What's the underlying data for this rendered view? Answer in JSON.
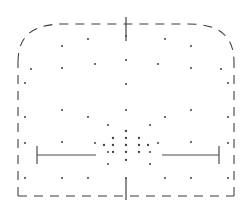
{
  "figure": {
    "type": "technical-line-drawing",
    "width": 252,
    "height": 212,
    "background_color": "#ffffff",
    "line_color": "#3a3a40",
    "dot_color": "#4b4b52",
    "accent_color": "#4a4a50"
  },
  "chart_data": {
    "type": "scatter",
    "xlabel": "",
    "ylabel": "",
    "xlim": [
      0,
      252
    ],
    "ylim": [
      212,
      0
    ],
    "grid": false,
    "legend": "none",
    "outline": {
      "name": "panel-outline",
      "style": "dashed",
      "dash_pattern": [
        9,
        7
      ],
      "left_edge_x": 18,
      "right_edge_x": 234,
      "bottom_y": 196,
      "shoulder_y": 62,
      "apex_y": 24,
      "corner_radius": 46
    },
    "centerline_ticks": [
      {
        "name": "top-centre-tick",
        "x": 126,
        "y1": 17,
        "y2": 41
      },
      {
        "name": "bottom-centre-tick",
        "x": 126,
        "y1": 178,
        "y2": 200
      }
    ],
    "scale_bars": [
      {
        "name": "left-scale-bar",
        "x1": 37,
        "x2": 96,
        "y": 155,
        "cap_side": "left",
        "cap_y1": 146,
        "cap_y2": 164
      },
      {
        "name": "right-scale-bar",
        "x1": 162,
        "x2": 219,
        "y": 155,
        "cap_side": "right",
        "cap_y1": 146,
        "cap_y2": 164
      }
    ],
    "grid_points": [
      [
        25,
        83
      ],
      [
        25,
        117
      ],
      [
        25,
        143
      ],
      [
        25,
        178
      ],
      [
        31,
        69
      ],
      [
        62,
        46
      ],
      [
        62,
        68
      ],
      [
        62,
        110
      ],
      [
        62,
        142
      ],
      [
        62,
        178
      ],
      [
        88,
        39
      ],
      [
        88,
        117
      ],
      [
        88,
        178
      ],
      [
        95,
        64
      ],
      [
        95,
        143
      ],
      [
        108,
        125
      ],
      [
        108,
        152
      ],
      [
        108,
        164
      ],
      [
        126,
        36
      ],
      [
        126,
        60
      ],
      [
        126,
        84
      ],
      [
        126,
        110
      ],
      [
        126,
        178
      ],
      [
        150,
        125
      ],
      [
        150,
        152
      ],
      [
        150,
        164
      ],
      [
        158,
        64
      ],
      [
        158,
        143
      ],
      [
        165,
        39
      ],
      [
        165,
        117
      ],
      [
        165,
        178
      ],
      [
        191,
        46
      ],
      [
        191,
        68
      ],
      [
        191,
        110
      ],
      [
        191,
        142
      ],
      [
        191,
        178
      ],
      [
        221,
        69
      ],
      [
        228,
        83
      ],
      [
        228,
        117
      ],
      [
        228,
        143
      ],
      [
        228,
        178
      ]
    ],
    "cluster_points": [
      [
        126,
        131
      ],
      [
        113,
        138
      ],
      [
        126,
        138
      ],
      [
        139,
        138
      ],
      [
        104,
        145
      ],
      [
        113,
        145
      ],
      [
        126,
        145
      ],
      [
        139,
        145
      ],
      [
        148,
        145
      ],
      [
        113,
        152
      ],
      [
        126,
        152
      ],
      [
        139,
        152
      ],
      [
        126,
        160
      ]
    ],
    "cluster_centre": [
      126,
      145
    ],
    "counts": {
      "grid_points": 41,
      "cluster_points": 13,
      "centerline_ticks": 2,
      "scale_bars": 2
    }
  }
}
